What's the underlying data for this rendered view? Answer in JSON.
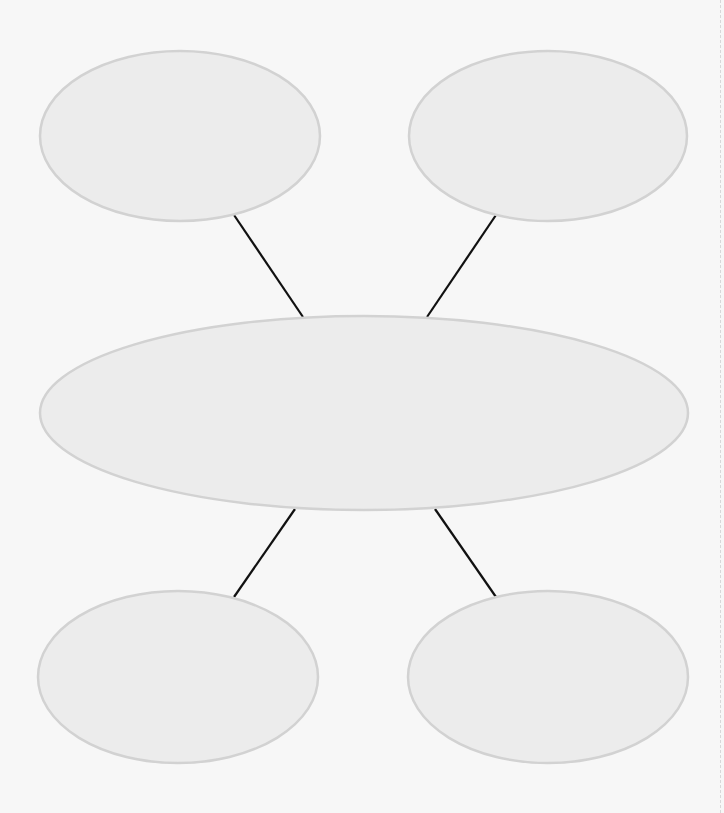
{
  "diagram": {
    "type": "mind-map",
    "colors": {
      "background": "#f7f7f7",
      "node_fill": "#ececec",
      "node_stroke": "#d2d2d2",
      "connector": "#111111",
      "page_edge": "#d8d8d8"
    },
    "nodes": [
      {
        "id": "top-left",
        "label": "",
        "cx": 180,
        "cy": 136,
        "rx": 140,
        "ry": 85
      },
      {
        "id": "top-right",
        "label": "",
        "cx": 548,
        "cy": 136,
        "rx": 139,
        "ry": 85
      },
      {
        "id": "center",
        "label": "",
        "cx": 364,
        "cy": 413,
        "rx": 324,
        "ry": 97
      },
      {
        "id": "bottom-left",
        "label": "",
        "cx": 178,
        "cy": 677,
        "rx": 140,
        "ry": 86
      },
      {
        "id": "bottom-right",
        "label": "",
        "cx": 548,
        "cy": 677,
        "rx": 140,
        "ry": 86
      }
    ],
    "connectors": [
      {
        "id": "center-to-top-left",
        "x1": 234,
        "y1": 215,
        "x2": 303,
        "y2": 317
      },
      {
        "id": "center-to-top-right",
        "x1": 496,
        "y1": 215,
        "x2": 427,
        "y2": 317
      },
      {
        "id": "center-to-bottom-left",
        "x1": 295,
        "y1": 509,
        "x2": 234,
        "y2": 597
      },
      {
        "id": "center-to-bottom-right",
        "x1": 435,
        "y1": 509,
        "x2": 496,
        "y2": 597
      }
    ]
  }
}
